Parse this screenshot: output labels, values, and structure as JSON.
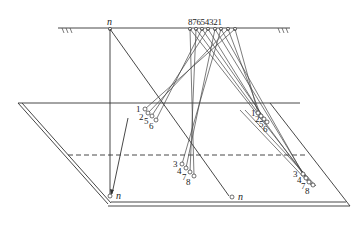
{
  "diagram": {
    "type": "perspective-projection-ray-diagram",
    "top_line_labels": {
      "n": "n",
      "numbers": "87654321"
    },
    "sources": [
      "8",
      "7",
      "6",
      "5",
      "4",
      "3",
      "2",
      "1"
    ],
    "cluster_upper_left": {
      "labels": [
        "1",
        "2",
        "5",
        "6"
      ]
    },
    "cluster_upper_right": {
      "labels": [
        "1",
        "2",
        "5",
        "6"
      ]
    },
    "cluster_lower_mid": {
      "labels": [
        "3",
        "4",
        "7",
        "8"
      ]
    },
    "cluster_lower_right": {
      "labels": [
        "3",
        "4",
        "7",
        "8"
      ]
    },
    "point_n_left": "n",
    "point_n_right": "n",
    "colors": {
      "line": "#333333",
      "background": "#ffffff"
    }
  }
}
